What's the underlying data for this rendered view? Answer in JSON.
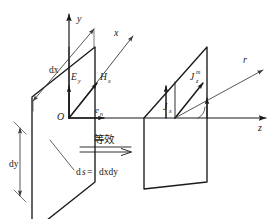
{
  "figure": {
    "kind": "electromagnetics-huygens-element-diagram",
    "axes": {
      "y_label": "y",
      "x_label": "x",
      "z_label": "z",
      "r_label": "r",
      "origin_label": "O"
    },
    "left_panel": {
      "name": "huygens-element",
      "dx_label": "dx",
      "dy_label": "dy",
      "e_field_label": "E",
      "e_field_sub": "y",
      "h_field_label": "H",
      "h_field_sub": "x",
      "unit_vector_label": "e",
      "unit_vector_sub": "n",
      "area_label": "ds = dxdy",
      "area_lhs": "d",
      "area_lhs_italic": "s",
      "area_eq": " = ",
      "area_rhs": "dxdy"
    },
    "right_panel": {
      "name": "equivalent-currents",
      "magnetic_current_label": "J",
      "magnetic_current_sub": "z",
      "magnetic_current_sup": "m",
      "electric_current_label": "J",
      "electric_current_sub": "x"
    },
    "transition": {
      "caption": "等效",
      "arrow_name": "double-line-arrow"
    },
    "colors": {
      "ink": "#1a1a1a",
      "thin_ink": "#3a3a3a",
      "background": "#ffffff"
    }
  }
}
